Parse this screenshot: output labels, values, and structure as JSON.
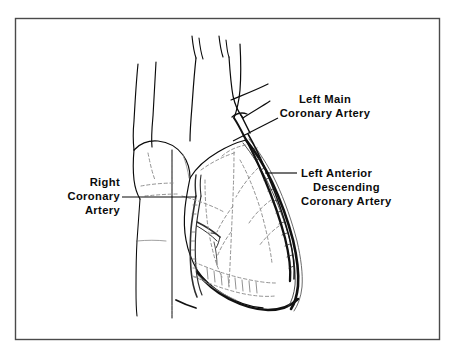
{
  "figure": {
    "style": "black and white line drawing, dashed interior detail",
    "border": {
      "present": true,
      "color": "#4a4a4a",
      "x": 15,
      "y": 18,
      "width": 425,
      "height": 322
    },
    "colors": {
      "background": "#ffffff",
      "ink": "#0b0b0b",
      "light_ink": "#7b7b7b",
      "dashed_ink": "#8a8a8a",
      "border": "#4a4a4a"
    }
  },
  "labels": [
    {
      "id": "left-main-coronary-artery",
      "lines": [
        "Left Main",
        "Coronary Artery"
      ],
      "align": "center",
      "anchor_x": 325,
      "first_line_y": 103,
      "line_height": 14,
      "leader": {
        "from_x": 278,
        "from_y": 118,
        "to_x": 233,
        "to_y": 141
      }
    },
    {
      "id": "left-anterior-descending-coronary-artery",
      "lines": [
        "Left Anterior",
        "Descending",
        "Coronary Artery"
      ],
      "align": "left",
      "anchor_x": 301,
      "first_line_y": 177,
      "line_height": 14,
      "leader": {
        "from_x": 297,
        "from_y": 173,
        "to_x": 265,
        "to_y": 173
      }
    },
    {
      "id": "right-coronary-artery",
      "lines": [
        "Right",
        "Coronary",
        "Artery"
      ],
      "align": "right",
      "anchor_x": 120,
      "first_line_y": 186,
      "line_height": 14,
      "leader": {
        "from_x": 122,
        "from_y": 197,
        "to_x": 196,
        "to_y": 197
      }
    }
  ],
  "anatomy": {
    "structures": [
      "superior vena cava",
      "ascending aorta",
      "aortic arch branches",
      "pulmonary trunk",
      "right atrium",
      "right ventricle",
      "left ventricle",
      "cardiac apex"
    ],
    "arteries": [
      "left main coronary artery",
      "left anterior descending coronary artery",
      "right coronary artery"
    ]
  }
}
